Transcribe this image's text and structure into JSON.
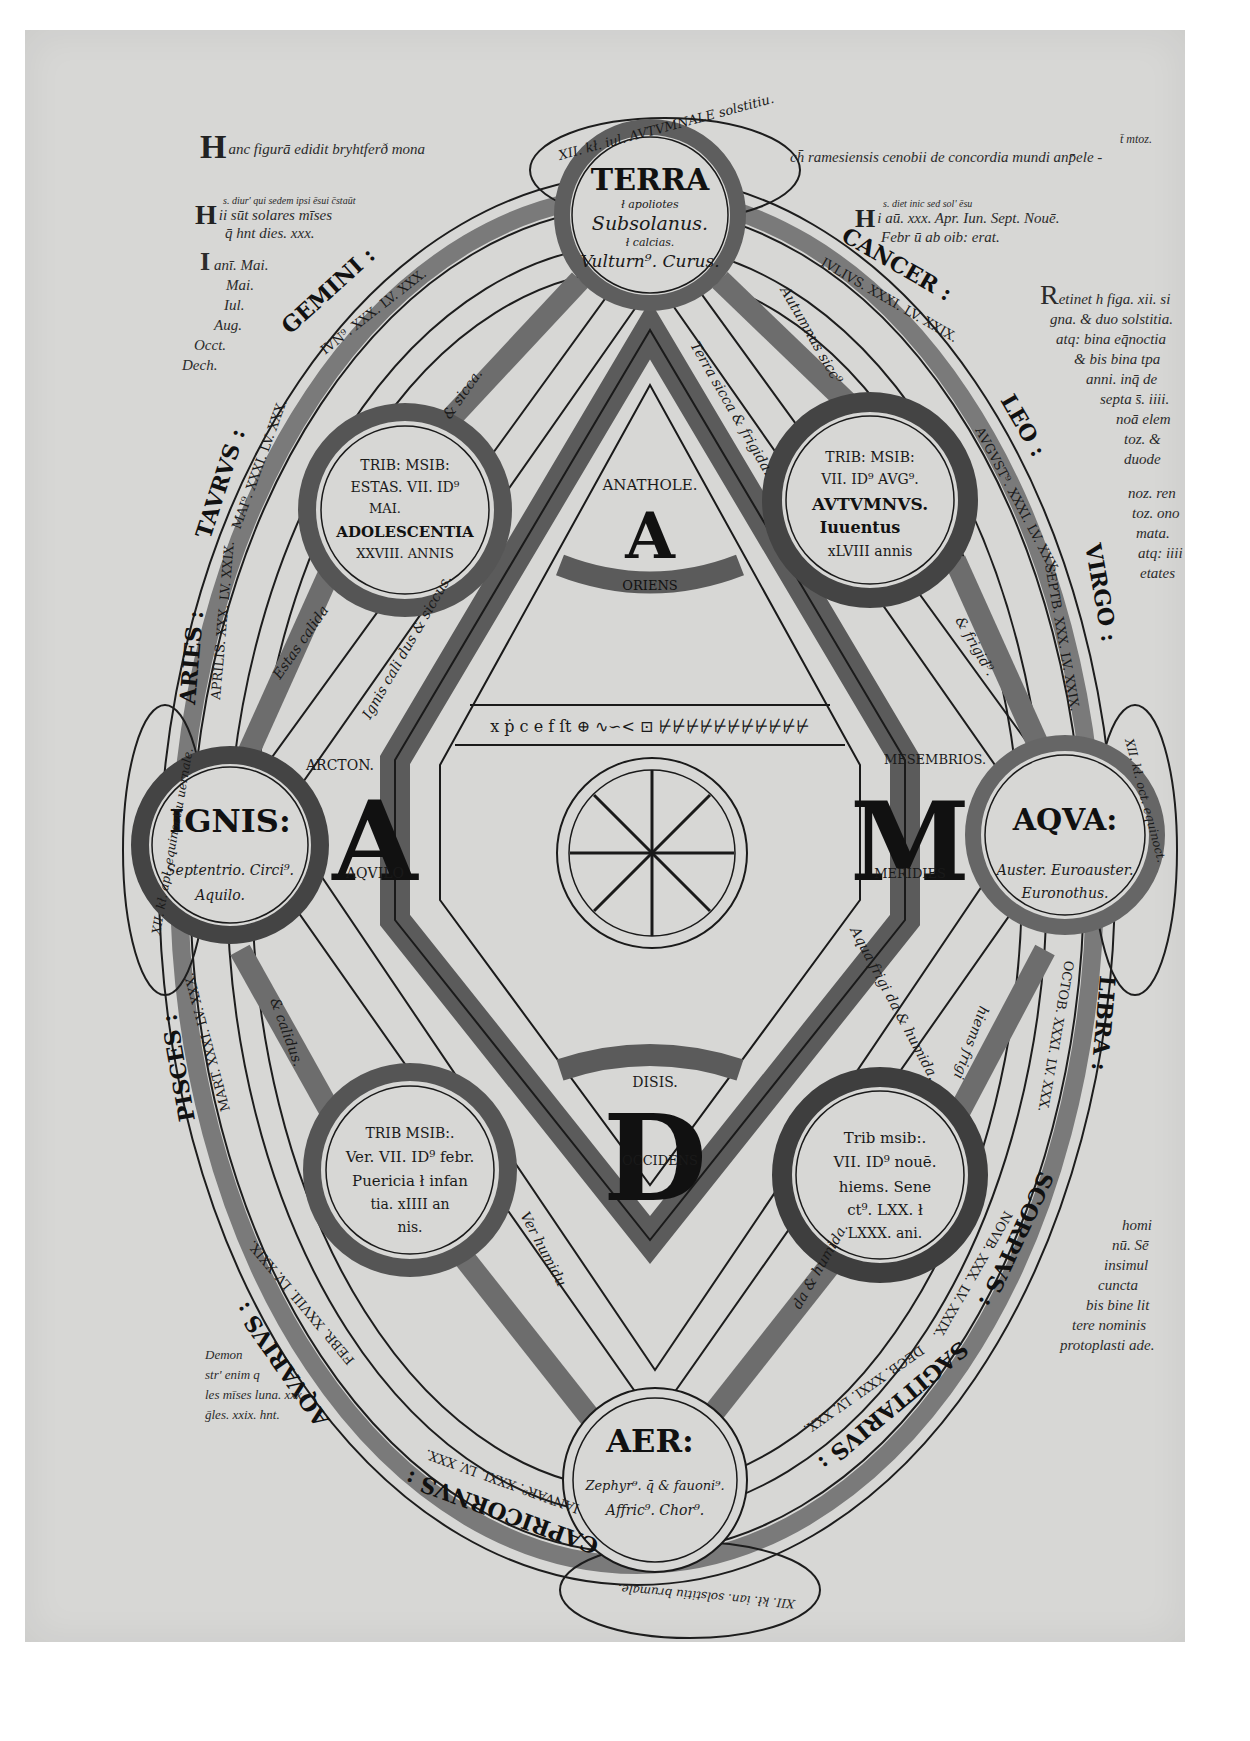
{
  "colors": {
    "page": "#d7d7d5",
    "ink": "#1b1b1b",
    "band": "#7d7d7d",
    "background": "#ffffff"
  },
  "margin_notes": {
    "top_left": {
      "initial": "H",
      "text": "anc figurā edidit bryhtferð mona"
    },
    "top_right": {
      "text": "ch̄ ramesiensis cenobii de concordia mundi anp̄ele -",
      "above": "t̄ mtoz."
    },
    "left_h": {
      "initial": "H",
      "small": "s. diur' qui sedem ipsi ēsui c̄staūt",
      "line1": "ii sūt solares mīses",
      "line2": "q̄ hnt dies. xxx."
    },
    "left_i": {
      "initial": "I",
      "lines": [
        "anī. Mai.",
        "Mai.",
        "Iul.",
        "Aug.",
        "Occt.",
        "Dech."
      ]
    },
    "right_h": {
      "initial": "H",
      "small": "s. diet inic sed sol' ēsu",
      "line1": "i aū. xxx. Apr. Iun. Sept. Nouē.",
      "line2": "Febr ū ab oib: erat."
    },
    "right_column": {
      "initial": "R",
      "lines": [
        "etinet h figa. xii. si",
        "gna. & duo solstitia.",
        "atq: bina eq̄noctia",
        "& bis bina tpa",
        "anni. inq̄ de",
        "septa s̄. iiii.",
        "noā elem",
        "toz. & duode",
        "noz. ren",
        "toz. ono",
        "mata.",
        "atq: iiii",
        "etates"
      ]
    },
    "right_bottom": {
      "lines": [
        "homi",
        "nū. Sē",
        "insimul",
        "cuncta",
        "bis bine lit",
        "tere nominis",
        "protoplasti ade."
      ]
    },
    "left_bottom": {
      "lines": [
        "Demon",
        "str' enim q",
        "les mīses luna. xxx.",
        "ḡles. xxix. hnt."
      ]
    }
  },
  "elements": {
    "terra": {
      "title": "TERRA",
      "l1": "ł apoliotes",
      "l2": "Subsolanus.",
      "l3": "ł calcias.",
      "l4": "Vulturn⁹. Curus."
    },
    "ignis": {
      "title": "IGNIS:",
      "l1": "Septentrio. Circi⁹.",
      "l2": "Aquilo."
    },
    "aqua": {
      "title": "AQVA:",
      "l1": "Auster. Euroauster.",
      "l2": "Euronothus."
    },
    "aer": {
      "title": "AER:",
      "l1": "Zephyr⁹. q̄ & fauoni⁹.",
      "l2": "Affric⁹. Chor⁹."
    }
  },
  "seasons": {
    "estas": {
      "l1": "TRIB: MSIB:",
      "l2": "ESTAS. VII. ID⁹",
      "l3": "MAI.",
      "l4": "ADOLESCENTIA",
      "l5": "XXVIII. ANNIS"
    },
    "autumnus": {
      "l1": "TRIB: MSIB:",
      "l2": "VII. ID⁹ AVG⁹.",
      "l3": "AVTVMNVS.",
      "l4": "Iuuentus",
      "l5": "xLVIII annis"
    },
    "ver": {
      "l1": "TRIB MSIB:.",
      "l2": "Ver. VII. ID⁹ febr.",
      "l3": "Puericia ł infan",
      "l4": "tia. xIIII an",
      "l5": "nis."
    },
    "hiems": {
      "l1": "Trib msib:.",
      "l2": "VII. ID⁹ nouē.",
      "l3": "hiems. Sene",
      "l4": "ct⁹. LXX. ł",
      "l5": "LXXX. ani."
    }
  },
  "adam": {
    "a_top": {
      "letter": "A",
      "above": "ANATHOLE.",
      "below": "ORIENS"
    },
    "d_bottom": {
      "letter": "D",
      "above": "DISIS.",
      "inside": "OCCIDENS"
    },
    "a_left": {
      "letter": "A",
      "above": "ARCTON.",
      "below": "AQVILO"
    },
    "m_right": {
      "letter": "M",
      "above": "MESEMBRIOS.",
      "below": "MERIDIES"
    }
  },
  "zodiac": [
    "GEMINI :",
    "CANCER :",
    "LEO :",
    "VIRGO :",
    "LIBRA :",
    "SCORPIVS :",
    "SAGITTARIVS :",
    "CAPRICORNVS :",
    "AQVARIVS :",
    "PISCES :",
    "ARIES :",
    "TAVRVS :"
  ],
  "months": {
    "gemini": "IVN⁹. XXX. LV. XXX.",
    "cancer": "IVLIVS. XXXI. LV. XXIX.",
    "leo": "AVGVST⁹. XXXI. LV. XXX.",
    "virgo": "SEPTB. XXX. LV. XXIX.",
    "libra": "OCTOB. XXXI. LV. XXX.",
    "scorpius": "NOVB. XXX. LV. XXIX.",
    "sagittarius": "DECB. XXXI. LV. XXX.",
    "capricornus": "IANVAR⁹. XXXI. LV. XXX.",
    "aquarius": "FEBR. XXVIII. LV. XXIX.",
    "pisces": "MART. XXXI. LV. XXX.",
    "aries": "APRILIS. XXX. LV. XXIX.",
    "taurus": "MAI⁹. XXXI. LV. XXX."
  },
  "qualities": {
    "top_left": "Estas calida",
    "top_left2": "& sicca.",
    "top_right": "Autumnus sicc⁹",
    "top_right2": "& frigid⁹.",
    "inner_tl": "Ignis cali dus & siccus.",
    "inner_tr": "Terra sicca & frigida.",
    "inner_bl": "& calidus.",
    "inner_br": "Aqua frigi da & humida.",
    "bottom_left": "Ver humidu",
    "bottom_left2": "& calidu.",
    "bottom_right": "hiems frigi",
    "bottom_right2": "da & humida."
  },
  "equinox_solstice": {
    "top": "XII. kł. iul. AVTVMNALE solstitiu.",
    "left": "XII. kł. apl. equinoctiu uernale.",
    "right": "XII. kł. oct. equinoct.",
    "bottom": "XII. kł. ian. solstitiu brumale."
  },
  "center_runes": {
    "row": "x ṗ c  e f ſt  ⊕  ∿∽<  ⊡  ⊬⊬⊬⊬⊬⊬⊬⊬⊬⊬⊬"
  }
}
